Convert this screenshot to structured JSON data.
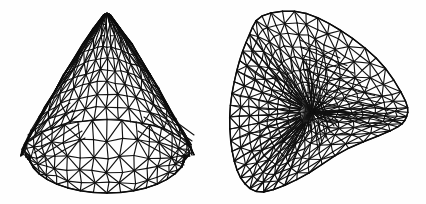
{
  "figure": {
    "panels": [
      {
        "id": "left",
        "view": "side view, apex up",
        "apex": [
          107,
          13
        ],
        "left_corner": [
          23,
          155
        ],
        "right_corner": [
          198,
          155
        ],
        "bottom": [
          107,
          193
        ],
        "rim_top_y": 118,
        "rings": 9,
        "segments": 22
      },
      {
        "id": "right",
        "view": "oblique view with fan center",
        "fan_center": [
          312,
          112
        ],
        "outline": [
          [
            262,
            16
          ],
          [
            300,
            12
          ],
          [
            340,
            30
          ],
          [
            380,
            62
          ],
          [
            405,
            100
          ],
          [
            406,
            118
          ],
          [
            392,
            130
          ],
          [
            345,
            150
          ],
          [
            300,
            178
          ],
          [
            262,
            192
          ],
          [
            242,
            180
          ],
          [
            232,
            150
          ],
          [
            230,
            110
          ],
          [
            237,
            70
          ],
          [
            248,
            38
          ]
        ],
        "rings": 8,
        "segments": 26
      }
    ],
    "colors": {
      "line": "#111111",
      "background": "#fefefe"
    }
  }
}
